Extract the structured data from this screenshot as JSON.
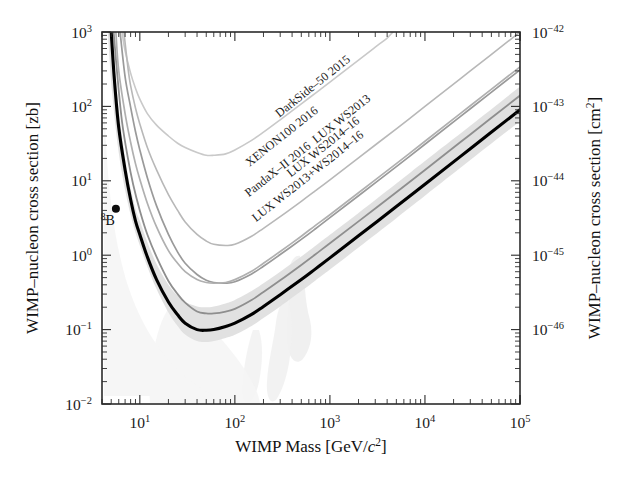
{
  "figure": {
    "background": "#ffffff",
    "frame_color": "#2b2b2b"
  },
  "axes": {
    "x": {
      "title_parts": {
        "main": "WIMP Mass [GeV/",
        "italic": "c",
        "sup": "2",
        "tail": "]"
      },
      "title_plain": "WIMP Mass [GeV/c2]",
      "scale": "log",
      "min": 4,
      "max": 100000,
      "ticklabels": [
        "10",
        "10",
        "10",
        "10",
        "10"
      ],
      "tickexponents": [
        "1",
        "2",
        "3",
        "4",
        "5"
      ],
      "tickvalues": [
        10,
        100,
        1000,
        10000,
        100000
      ]
    },
    "y_left": {
      "title": "WIMP–nucleon cross section [zb]",
      "scale": "log",
      "min": 0.01,
      "max": 1000,
      "ticklabels": [
        "10",
        "10",
        "10",
        "10",
        "10",
        "10"
      ],
      "tickexponents": [
        "3",
        "2",
        "1",
        "0",
        "−1",
        "−2"
      ],
      "tickvalues": [
        1000,
        100,
        10,
        1,
        0.1,
        0.01
      ]
    },
    "y_right": {
      "title_parts": {
        "main": "WIMP–nucleon cross section [cm",
        "sup": "2",
        "tail": "]"
      },
      "title_plain": "WIMP-nucleon cross section [cm2]",
      "scale": "log",
      "ticklabels": [
        "10",
        "10",
        "10",
        "10",
        "10"
      ],
      "tickexponents": [
        "−42",
        "−43",
        "−44",
        "−45",
        "−46"
      ],
      "tickvalues": [
        1e-42,
        1e-43,
        1e-44,
        1e-45,
        1e-46
      ]
    }
  },
  "annotations": {
    "b8_marker": {
      "label_sup": "8",
      "label_main": "B",
      "mass_gev": 5.6,
      "sigma_zb": 4.2
    }
  },
  "chart_data": {
    "type": "line",
    "title": "",
    "xlabel": "WIMP Mass [GeV/c2]",
    "ylabel": "WIMP-nucleon cross section [zb]",
    "ylabel_right": "WIMP-nucleon cross section [cm2]",
    "xscale": "log",
    "yscale": "log",
    "xlim": [
      4,
      100000
    ],
    "ylim": [
      0.01,
      1000
    ],
    "ylim_right": [
      1e-41,
      1e-46
    ],
    "unit_note": "1 zb = 1e-45 cm2",
    "grid": false,
    "legend": "inline curve labels",
    "series": [
      {
        "name": "DarkSide–50 2015",
        "color": "#c9c9c9",
        "width": 1.6,
        "label_anchor_mass": 700,
        "label_anchor_sigma": 170,
        "points": [
          [
            6.5,
            1000
          ],
          [
            7,
            560
          ],
          [
            8,
            280
          ],
          [
            9,
            175
          ],
          [
            10,
            125
          ],
          [
            12,
            80
          ],
          [
            15,
            56
          ],
          [
            20,
            40
          ],
          [
            25,
            32
          ],
          [
            30,
            28
          ],
          [
            40,
            24
          ],
          [
            50,
            22
          ],
          [
            60,
            22
          ],
          [
            80,
            23
          ],
          [
            100,
            26
          ],
          [
            150,
            35
          ],
          [
            200,
            45
          ],
          [
            300,
            66
          ],
          [
            500,
            108
          ],
          [
            700,
            150
          ],
          [
            1000,
            212
          ],
          [
            2000,
            420
          ],
          [
            3000,
            625
          ],
          [
            4000,
            830
          ],
          [
            4600,
            1000
          ]
        ]
      },
      {
        "name": "XENON100 2016",
        "color": "#b8b8b8",
        "width": 1.6,
        "label_anchor_mass": 330,
        "label_anchor_sigma": 36,
        "points": [
          [
            6.8,
            1000
          ],
          [
            7.5,
            330
          ],
          [
            8,
            190
          ],
          [
            9,
            95
          ],
          [
            10,
            58
          ],
          [
            12,
            28
          ],
          [
            15,
            14
          ],
          [
            20,
            6.5
          ],
          [
            25,
            4.0
          ],
          [
            30,
            2.8
          ],
          [
            40,
            1.9
          ],
          [
            50,
            1.55
          ],
          [
            60,
            1.4
          ],
          [
            80,
            1.35
          ],
          [
            100,
            1.4
          ],
          [
            150,
            1.8
          ],
          [
            200,
            2.3
          ],
          [
            300,
            3.3
          ],
          [
            500,
            5.3
          ],
          [
            700,
            7.3
          ],
          [
            1000,
            10.3
          ],
          [
            2000,
            20.4
          ],
          [
            5000,
            50
          ],
          [
            10000,
            100
          ],
          [
            30000,
            300
          ],
          [
            100000,
            1000
          ]
        ]
      },
      {
        "name": "PandaX–II 2016",
        "color": "#9a9a9a",
        "width": 1.7,
        "label_anchor_mass": 300,
        "label_anchor_sigma": 13,
        "points": [
          [
            6.2,
            1000
          ],
          [
            7,
            250
          ],
          [
            8,
            98
          ],
          [
            9,
            46
          ],
          [
            10,
            26
          ],
          [
            12,
            11
          ],
          [
            15,
            4.6
          ],
          [
            20,
            1.9
          ],
          [
            25,
            1.1
          ],
          [
            30,
            0.78
          ],
          [
            40,
            0.55
          ],
          [
            50,
            0.46
          ],
          [
            60,
            0.43
          ],
          [
            80,
            0.42
          ],
          [
            100,
            0.44
          ],
          [
            150,
            0.56
          ],
          [
            200,
            0.71
          ],
          [
            300,
            1.02
          ],
          [
            500,
            1.63
          ],
          [
            700,
            2.25
          ],
          [
            1000,
            3.2
          ],
          [
            2000,
            6.3
          ],
          [
            5000,
            15.5
          ],
          [
            10000,
            31
          ],
          [
            30000,
            93
          ],
          [
            100000,
            310
          ]
        ]
      },
      {
        "name": "LUX WS2013",
        "color": "#b0b0b0",
        "width": 1.7,
        "label_anchor_mass": 1400,
        "label_anchor_sigma": 62,
        "points": [
          [
            5.6,
            1000
          ],
          [
            6,
            300
          ],
          [
            7,
            80
          ],
          [
            8,
            33
          ],
          [
            9,
            17
          ],
          [
            10,
            10.5
          ],
          [
            12,
            5.0
          ],
          [
            15,
            2.4
          ],
          [
            20,
            1.15
          ],
          [
            25,
            0.78
          ],
          [
            30,
            0.6
          ],
          [
            40,
            0.47
          ],
          [
            50,
            0.43
          ],
          [
            60,
            0.42
          ],
          [
            80,
            0.43
          ],
          [
            100,
            0.47
          ],
          [
            150,
            0.61
          ],
          [
            200,
            0.78
          ],
          [
            300,
            1.12
          ],
          [
            500,
            1.8
          ],
          [
            700,
            2.5
          ],
          [
            1000,
            3.5
          ],
          [
            2000,
            6.9
          ],
          [
            5000,
            17
          ],
          [
            10000,
            34
          ],
          [
            30000,
            102
          ],
          [
            100000,
            340
          ]
        ]
      },
      {
        "name": "LUX WS2014–16",
        "color": "#8e8e8e",
        "width": 1.8,
        "label_anchor_mass": 900,
        "label_anchor_sigma": 26,
        "points": [
          [
            5.3,
            1000
          ],
          [
            5.8,
            260
          ],
          [
            6.5,
            62
          ],
          [
            7.5,
            20
          ],
          [
            8.5,
            9.0
          ],
          [
            10,
            4.0
          ],
          [
            12,
            1.9
          ],
          [
            15,
            0.95
          ],
          [
            20,
            0.45
          ],
          [
            25,
            0.3
          ],
          [
            30,
            0.23
          ],
          [
            40,
            0.175
          ],
          [
            50,
            0.165
          ],
          [
            60,
            0.165
          ],
          [
            80,
            0.175
          ],
          [
            100,
            0.19
          ],
          [
            150,
            0.25
          ],
          [
            200,
            0.32
          ],
          [
            300,
            0.46
          ],
          [
            500,
            0.74
          ],
          [
            700,
            1.02
          ],
          [
            1000,
            1.45
          ],
          [
            2000,
            2.85
          ],
          [
            5000,
            7.0
          ],
          [
            10000,
            14
          ],
          [
            30000,
            42
          ],
          [
            100000,
            140
          ]
        ]
      },
      {
        "name": "LUX WS2013+WS2014–16",
        "color": "#000000",
        "width": 3.1,
        "label_anchor_mass": 620,
        "label_anchor_sigma": 10.5,
        "points": [
          [
            5.0,
            1000
          ],
          [
            5.4,
            230
          ],
          [
            6,
            52
          ],
          [
            7,
            14
          ],
          [
            8,
            5.6
          ],
          [
            9,
            2.9
          ],
          [
            10,
            1.9
          ],
          [
            12,
            0.95
          ],
          [
            15,
            0.47
          ],
          [
            20,
            0.235
          ],
          [
            25,
            0.158
          ],
          [
            30,
            0.122
          ],
          [
            40,
            0.1
          ],
          [
            50,
            0.098
          ],
          [
            60,
            0.1
          ],
          [
            80,
            0.11
          ],
          [
            100,
            0.122
          ],
          [
            150,
            0.16
          ],
          [
            200,
            0.205
          ],
          [
            300,
            0.295
          ],
          [
            500,
            0.47
          ],
          [
            700,
            0.65
          ],
          [
            1000,
            0.92
          ],
          [
            2000,
            1.82
          ],
          [
            5000,
            4.5
          ],
          [
            10000,
            9.0
          ],
          [
            30000,
            27
          ],
          [
            100000,
            90
          ]
        ]
      }
    ],
    "bands": [
      {
        "name": "LUX WS2013+WS2014-16 1-sigma sensitivity band",
        "color": "#dedede",
        "opacity": 0.95,
        "upper": [
          [
            5.0,
            1000
          ],
          [
            5.6,
            210
          ],
          [
            6.5,
            40
          ],
          [
            7.5,
            12
          ],
          [
            9,
            4.2
          ],
          [
            10,
            2.9
          ],
          [
            12,
            1.5
          ],
          [
            15,
            0.76
          ],
          [
            20,
            0.4
          ],
          [
            25,
            0.285
          ],
          [
            30,
            0.235
          ],
          [
            40,
            0.205
          ],
          [
            50,
            0.2
          ],
          [
            60,
            0.205
          ],
          [
            80,
            0.225
          ],
          [
            100,
            0.25
          ],
          [
            150,
            0.33
          ],
          [
            200,
            0.42
          ],
          [
            300,
            0.6
          ],
          [
            500,
            0.96
          ],
          [
            700,
            1.33
          ],
          [
            1000,
            1.88
          ],
          [
            2000,
            3.7
          ],
          [
            5000,
            9.2
          ],
          [
            10000,
            18.5
          ],
          [
            30000,
            55
          ],
          [
            100000,
            185
          ]
        ],
        "lower": [
          [
            4.6,
            1000
          ],
          [
            5.1,
            160
          ],
          [
            5.9,
            28
          ],
          [
            7,
            7.5
          ],
          [
            8.5,
            2.6
          ],
          [
            10,
            1.35
          ],
          [
            12,
            0.7
          ],
          [
            15,
            0.35
          ],
          [
            20,
            0.17
          ],
          [
            25,
            0.112
          ],
          [
            30,
            0.086
          ],
          [
            40,
            0.07
          ],
          [
            50,
            0.068
          ],
          [
            60,
            0.07
          ],
          [
            80,
            0.077
          ],
          [
            100,
            0.085
          ],
          [
            150,
            0.112
          ],
          [
            200,
            0.143
          ],
          [
            300,
            0.205
          ],
          [
            500,
            0.33
          ],
          [
            700,
            0.455
          ],
          [
            1000,
            0.64
          ],
          [
            2000,
            1.27
          ],
          [
            5000,
            3.15
          ],
          [
            10000,
            6.3
          ],
          [
            30000,
            19
          ],
          [
            100000,
            63
          ]
        ]
      }
    ],
    "shaded_regions": [
      {
        "name": "neutrino-floor-blob-a",
        "color": "#ededed"
      },
      {
        "name": "neutrino-floor-blob-b",
        "color": "#f0f0f0"
      },
      {
        "name": "neutrino-floor-blob-c",
        "color": "#f2f2f2"
      }
    ]
  }
}
